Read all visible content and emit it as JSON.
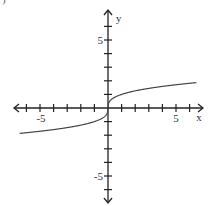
{
  "corner_label": ")",
  "chart_data": {
    "type": "line",
    "title": "",
    "function": "y = cbrt(x)",
    "xlabel": "x",
    "ylabel": "y",
    "xlim": [
      -7,
      7
    ],
    "ylim": [
      -7,
      7
    ],
    "grid": false,
    "x_tick_step": 1,
    "y_tick_step": 1,
    "x_tick_labels": [
      {
        "value": -5,
        "text": "-5"
      },
      {
        "value": 5,
        "text": "5"
      }
    ],
    "y_tick_labels": [
      {
        "value": 5,
        "text": "5"
      },
      {
        "value": -5,
        "text": "-5"
      }
    ],
    "series": [
      {
        "name": "curve",
        "x": [
          -6.5,
          -6,
          -5,
          -4,
          -3,
          -2,
          -1,
          -0.5,
          -0.1,
          0,
          0.1,
          0.5,
          1,
          2,
          3,
          4,
          5,
          6,
          6.5
        ],
        "y": [
          -1.87,
          -1.82,
          -1.71,
          -1.59,
          -1.44,
          -1.26,
          -1.0,
          -0.79,
          -0.46,
          0,
          0.46,
          0.79,
          1.0,
          1.26,
          1.44,
          1.59,
          1.71,
          1.82,
          1.87
        ]
      }
    ],
    "colors": {
      "axis": "#222222",
      "curve": "#444444",
      "text": "#333333"
    }
  }
}
